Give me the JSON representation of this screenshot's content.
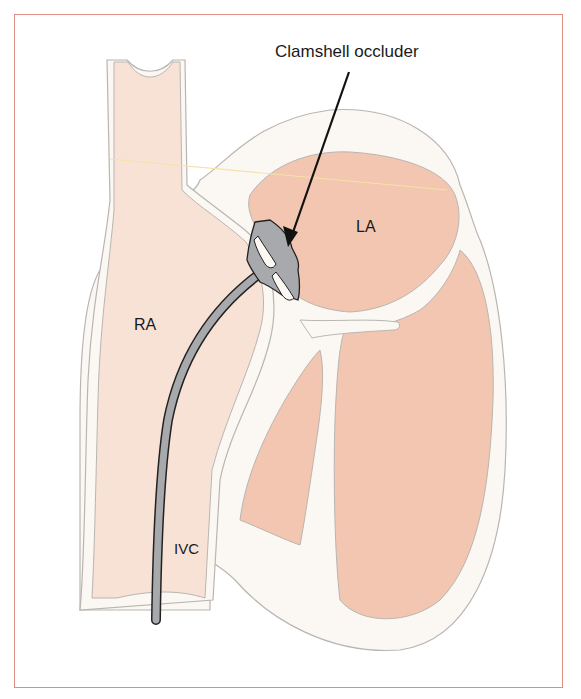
{
  "figure": {
    "annotation": "Clamshell occluder",
    "labels": {
      "la": "LA",
      "ra": "RA",
      "ivc": "IVC"
    }
  },
  "colors": {
    "frame_border": "#e08c84",
    "chamber_fill_light": "#f8e2d6",
    "chamber_fill_dark": "#f2c6b0",
    "wall_fill": "#fbf8f3",
    "wall_outline": "#b9b5b2",
    "device_fill": "#a7a9ac",
    "device_outline": "#222222",
    "arrow": "#111111",
    "fold_line": "#f5e2a8"
  }
}
